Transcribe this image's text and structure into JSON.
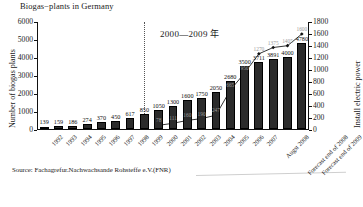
{
  "chart_title": "Biogas−plants in Germany",
  "annotation": "2000—2009 年",
  "source": "Source: Fachagrefur.Nachwachsande Rohsteffe e.V.(FNR)",
  "axes": {
    "left_title": "Number of biogas plants",
    "right_title": "Install electric power",
    "left_ticks": [
      "0",
      "1000",
      "2000",
      "3000",
      "4000",
      "5000",
      "6000"
    ],
    "right_ticks": [
      "0",
      "200",
      "400",
      "600",
      "800",
      "1000",
      "1200",
      "1400",
      "1600",
      "1800"
    ]
  },
  "chart_data": {
    "type": "bar",
    "title": "Biogas−plants in Germany",
    "subtitle": "2000—2009 年",
    "xlabel": "",
    "ylabel": "Number of biogas plants",
    "y2label": "Install electric power",
    "ylim": [
      0,
      6000
    ],
    "y2lim": [
      0,
      1800
    ],
    "grid": false,
    "legend": "none",
    "categories": [
      "1992",
      "1993",
      "1994",
      "1995",
      "1996",
      "1997",
      "1998",
      "1999",
      "2000",
      "2001",
      "2002",
      "2003",
      "2004",
      "2005",
      "2006",
      "2007",
      "Augst 2008",
      "Forecast end of 2008",
      "Forecast end of 2009"
    ],
    "series": [
      {
        "name": "Number of biogas plants",
        "type": "bar",
        "axis": "left",
        "values": [
          139,
          159,
          186,
          274,
          370,
          450,
          617,
          850,
          1050,
          1300,
          1600,
          1750,
          2050,
          2680,
          3500,
          3711,
          3891,
          4000,
          4780
        ],
        "labels": [
          "139",
          "159",
          "186",
          "274",
          "370",
          "450",
          "617",
          "850",
          "1050",
          "1300",
          "1600",
          "1750",
          "2050",
          "2680",
          "3500",
          "3711",
          "3891",
          "4000",
          "4780"
        ]
      },
      {
        "name": "Install electric power",
        "type": "line",
        "axis": "right",
        "values": [
          null,
          null,
          null,
          null,
          null,
          null,
          null,
          null,
          78,
          111,
          160,
          190,
          247,
          665,
          950,
          1270,
          1375,
          1405,
          1600
        ],
        "labels": [
          "",
          "",
          "",
          "",
          "",
          "",
          "",
          "",
          "78",
          "111",
          "160",
          "190",
          "247",
          "665",
          "950",
          "1270",
          "1375",
          "1405",
          "1600"
        ]
      }
    ]
  }
}
